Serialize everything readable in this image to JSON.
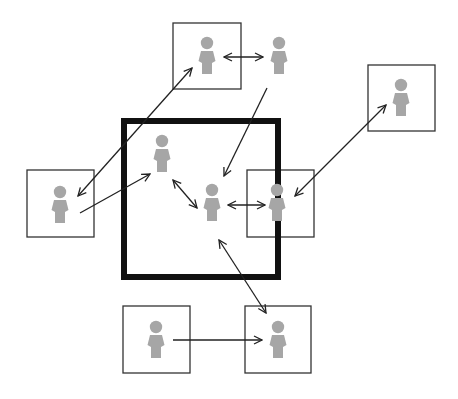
{
  "diagram": {
    "title": "Network of people inside and outside a boundary",
    "colors": {
      "background": "#ffffff",
      "person": "#a6a6a6",
      "box_stroke": "#333333",
      "boundary_stroke": "#111111",
      "arrow": "#222222"
    },
    "boundary": {
      "label": "boundary",
      "x": 124,
      "y": 121,
      "w": 154,
      "h": 156,
      "stroke_width": 6
    },
    "boxes": [
      {
        "id": "box-top",
        "x": 173,
        "y": 23,
        "w": 68,
        "h": 66
      },
      {
        "id": "box-right",
        "x": 368,
        "y": 65,
        "w": 67,
        "h": 66
      },
      {
        "id": "box-left",
        "x": 27,
        "y": 170,
        "w": 67,
        "h": 67
      },
      {
        "id": "box-mid-right",
        "x": 247,
        "y": 170,
        "w": 67,
        "h": 67
      },
      {
        "id": "box-bottom-left",
        "x": 123,
        "y": 306,
        "w": 67,
        "h": 67
      },
      {
        "id": "box-bottom-right",
        "x": 245,
        "y": 306,
        "w": 66,
        "h": 67
      }
    ],
    "people": [
      {
        "id": "p-top",
        "cx": 207,
        "cy": 56
      },
      {
        "id": "p-top-free",
        "cx": 279,
        "cy": 56
      },
      {
        "id": "p-right",
        "cx": 401,
        "cy": 98
      },
      {
        "id": "p-left",
        "cx": 60,
        "cy": 205
      },
      {
        "id": "p-inner",
        "cx": 162,
        "cy": 154
      },
      {
        "id": "p-center",
        "cx": 212,
        "cy": 203
      },
      {
        "id": "p-mid-right",
        "cx": 277,
        "cy": 203
      },
      {
        "id": "p-bottom-left",
        "cx": 156,
        "cy": 340
      },
      {
        "id": "p-bottom-right",
        "cx": 278,
        "cy": 340
      }
    ],
    "arrows": [
      {
        "id": "a-top-topfree",
        "x1": 224,
        "y1": 57,
        "x2": 263,
        "y2": 57,
        "start": true,
        "end": true
      },
      {
        "id": "a-left-top",
        "x1": 78,
        "y1": 196,
        "x2": 192,
        "y2": 68,
        "start": true,
        "end": true
      },
      {
        "id": "a-left-inner",
        "x1": 80,
        "y1": 213,
        "x2": 150,
        "y2": 174,
        "start": false,
        "end": true
      },
      {
        "id": "a-topfree-center",
        "x1": 267,
        "y1": 88,
        "x2": 224,
        "y2": 176,
        "start": false,
        "end": true
      },
      {
        "id": "a-inner-center",
        "x1": 173,
        "y1": 180,
        "x2": 197,
        "y2": 208,
        "start": true,
        "end": true
      },
      {
        "id": "a-center-midright",
        "x1": 228,
        "y1": 205,
        "x2": 265,
        "y2": 205,
        "start": true,
        "end": true
      },
      {
        "id": "a-right-midright",
        "x1": 386,
        "y1": 105,
        "x2": 295,
        "y2": 196,
        "start": true,
        "end": true
      },
      {
        "id": "a-center-bottomright",
        "x1": 219,
        "y1": 240,
        "x2": 266,
        "y2": 313,
        "start": true,
        "end": true
      },
      {
        "id": "a-bottomleft-bottomright",
        "x1": 173,
        "y1": 340,
        "x2": 262,
        "y2": 340,
        "start": false,
        "end": true
      }
    ]
  }
}
